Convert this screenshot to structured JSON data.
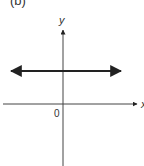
{
  "figure": {
    "panel_label": "(b)",
    "axes": {
      "x_label": "x",
      "y_label": "y",
      "origin_label": "0"
    },
    "curve": {
      "description": "horizontal line y = constant (positive), arrows at both ends",
      "type": "horizontal-line"
    },
    "colors": {
      "ink": "#222222",
      "background": "#ffffff"
    }
  }
}
